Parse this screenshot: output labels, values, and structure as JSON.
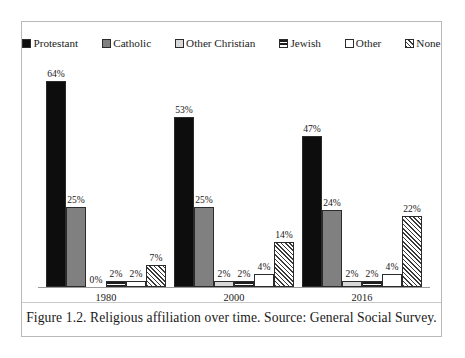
{
  "figure": {
    "caption": "Figure 1.2. Religious affiliation over time. Source: General Social Survey."
  },
  "chart_data": {
    "type": "bar",
    "title": "",
    "xlabel": "",
    "ylabel": "",
    "ylim": [
      0,
      70
    ],
    "grid": false,
    "legend_position": "top",
    "categories": [
      "1980",
      "2000",
      "2016"
    ],
    "series": [
      {
        "name": "Protestant",
        "pattern": "solid-black",
        "color": "#0d0d0d",
        "values": [
          64,
          53,
          47
        ],
        "labels": [
          "64%",
          "53%",
          "47%"
        ]
      },
      {
        "name": "Catholic",
        "pattern": "gray",
        "color": "#808080",
        "values": [
          25,
          25,
          24
        ],
        "labels": [
          "25%",
          "25%",
          "24%"
        ]
      },
      {
        "name": "Other Christian",
        "pattern": "lightgray",
        "color": "#d8d8d8",
        "values": [
          0,
          2,
          2
        ],
        "labels": [
          "0%",
          "2%",
          "2%"
        ]
      },
      {
        "name": "Jewish",
        "pattern": "hstripe",
        "color": "#1d1d1d",
        "values": [
          2,
          2,
          2
        ],
        "labels": [
          "2%",
          "2%",
          "2%"
        ]
      },
      {
        "name": "Other",
        "pattern": "white",
        "color": "#ffffff",
        "values": [
          2,
          4,
          4
        ],
        "labels": [
          "2%",
          "4%",
          "4%"
        ]
      },
      {
        "name": "None",
        "pattern": "hatch",
        "color": "#3a3a3a",
        "values": [
          7,
          14,
          22
        ],
        "labels": [
          "7%",
          "14%",
          "22%"
        ]
      }
    ]
  },
  "legend": {
    "items": [
      {
        "label": "Protestant",
        "swatch": "legend-swatch-protestant"
      },
      {
        "label": "Catholic",
        "swatch": "legend-swatch-catholic"
      },
      {
        "label": "Other Christian",
        "swatch": "legend-swatch-other-christian"
      },
      {
        "label": "Jewish",
        "swatch": "legend-swatch-jewish"
      },
      {
        "label": "Other",
        "swatch": "legend-swatch-other"
      },
      {
        "label": "None",
        "swatch": "legend-swatch-none"
      }
    ]
  }
}
